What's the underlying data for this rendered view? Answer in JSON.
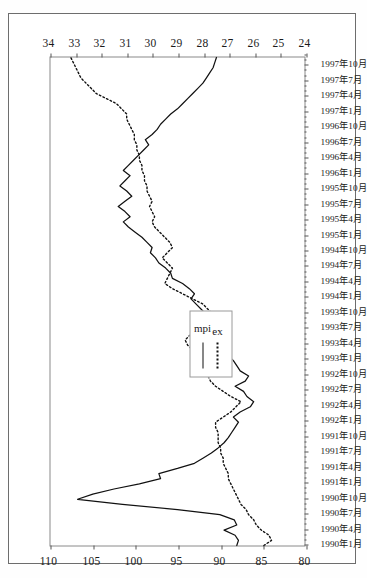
{
  "figure": {
    "orientation": "rotated-90-ccw",
    "background_color": "#ffffff",
    "border_color": "#6d6d6d"
  },
  "legend": {
    "position": "center-left",
    "entries": [
      {
        "label": "mpi",
        "style": "solid",
        "color": "#111111"
      },
      {
        "label": "ex",
        "style": "dotted",
        "color": "#111111"
      }
    ]
  },
  "chart_data": {
    "type": "line",
    "title": "",
    "subtitle": "",
    "xlabel": "",
    "ylabel": "",
    "grid": false,
    "legend_position": "center-left",
    "axes": {
      "left": {
        "name": "mpi",
        "lim": [
          80,
          110
        ],
        "ticks": [
          80,
          85,
          90,
          95,
          100,
          105,
          110
        ],
        "tick_labels": [
          "80",
          "85",
          "90",
          "95",
          "100",
          "105",
          "110"
        ]
      },
      "right": {
        "name": "ex",
        "lim": [
          24,
          34
        ],
        "ticks": [
          24,
          25,
          26,
          27,
          28,
          29,
          30,
          31,
          32,
          33,
          34
        ],
        "tick_labels": [
          "24",
          "25",
          "26",
          "27",
          "28",
          "29",
          "30",
          "31",
          "32",
          "33",
          "34"
        ]
      }
    },
    "x": [
      "1990年1月",
      "1990年2月",
      "1990年3月",
      "1990年4月",
      "1990年5月",
      "1990年6月",
      "1990年7月",
      "1990年8月",
      "1990年9月",
      "1990年10月",
      "1990年11月",
      "1990年12月",
      "1991年1月",
      "1991年2月",
      "1991年3月",
      "1991年4月",
      "1991年5月",
      "1991年6月",
      "1991年7月",
      "1991年8月",
      "1991年9月",
      "1991年10月",
      "1991年11月",
      "1991年12月",
      "1992年1月",
      "1992年2月",
      "1992年3月",
      "1992年4月",
      "1992年5月",
      "1992年6月",
      "1992年7月",
      "1992年8月",
      "1992年9月",
      "1992年10月",
      "1992年11月",
      "1992年12月",
      "1993年1月",
      "1993年2月",
      "1993年3月",
      "1993年4月",
      "1993年5月",
      "1993年6月",
      "1993年7月",
      "1993年8月",
      "1993年9月",
      "1993年10月",
      "1993年11月",
      "1993年12月",
      "1994年1月",
      "1994年2月",
      "1994年3月",
      "1994年4月",
      "1994年5月",
      "1994年6月",
      "1994年7月",
      "1994年8月",
      "1994年9月",
      "1994年10月",
      "1994年11月",
      "1994年12月",
      "1995年1月",
      "1995年2月",
      "1995年3月",
      "1995年4月",
      "1995年5月",
      "1995年6月",
      "1995年7月",
      "1995年8月",
      "1995年9月",
      "1995年10月",
      "1995年11月",
      "1995年12月",
      "1996年1月",
      "1996年2月",
      "1996年3月",
      "1996年4月",
      "1996年5月",
      "1996年6月",
      "1996年7月",
      "1996年8月",
      "1996年9月",
      "1996年10月",
      "1996年11月",
      "1996年12月",
      "1997年1月",
      "1997年2月",
      "1997年3月",
      "1997年4月",
      "1997年5月",
      "1997年6月",
      "1997年7月",
      "1997年8月",
      "1997年9月",
      "1997年10月",
      "1997年11月",
      "1997年12月"
    ],
    "x_tick_labels": [
      "1990年1月",
      "1990年4月",
      "1990年7月",
      "1990年10月",
      "1991年1月",
      "1991年4月",
      "1991年7月",
      "1991年10月",
      "1992年1月",
      "1992年4月",
      "1992年7月",
      "1992年10月",
      "1993年1月",
      "1993年4月",
      "1993年7月",
      "1993年10月",
      "1994年1月",
      "1994年4月",
      "1994年7月",
      "1994年10月",
      "1995年1月",
      "1995年4月",
      "1995年7月",
      "1995年10月",
      "1996年1月",
      "1996年4月",
      "1996年7月",
      "1996年10月",
      "1997年1月",
      "1997年4月",
      "1997年7月",
      "1997年10月"
    ],
    "series": [
      {
        "name": "mpi",
        "axis": "left",
        "style": "solid",
        "values": [
          88.0,
          87.8,
          88.2,
          89.5,
          88.0,
          88.3,
          90.0,
          95.0,
          101.5,
          106.8,
          105.0,
          102.5,
          99.5,
          97.0,
          97.2,
          95.0,
          93.0,
          92.0,
          91.0,
          90.2,
          89.5,
          89.0,
          88.6,
          88.2,
          87.8,
          88.4,
          87.6,
          86.4,
          86.0,
          86.8,
          87.2,
          88.2,
          87.0,
          86.6,
          87.6,
          88.0,
          88.4,
          89.0,
          89.6,
          91.4,
          90.0,
          89.4,
          89.8,
          90.6,
          91.2,
          91.6,
          92.2,
          92.8,
          93.4,
          93.0,
          93.6,
          94.4,
          95.6,
          95.8,
          96.4,
          97.2,
          97.6,
          98.2,
          98.0,
          98.6,
          99.2,
          100.0,
          100.8,
          101.4,
          100.6,
          101.2,
          102.0,
          101.2,
          100.4,
          101.0,
          101.8,
          101.2,
          100.6,
          101.4,
          100.8,
          100.2,
          99.6,
          99.0,
          98.4,
          98.8,
          98.0,
          97.4,
          97.0,
          96.4,
          95.8,
          95.0,
          94.4,
          93.8,
          93.2,
          92.6,
          92.0,
          91.6,
          91.2,
          90.8,
          90.6,
          90.4
        ]
      },
      {
        "name": "ex",
        "axis": "right",
        "style": "dotted",
        "values": [
          25.6,
          25.3,
          25.4,
          25.7,
          25.9,
          26.0,
          26.2,
          26.3,
          26.5,
          26.6,
          26.7,
          26.8,
          26.9,
          27.0,
          27.0,
          27.1,
          27.2,
          27.2,
          27.3,
          27.3,
          27.4,
          27.4,
          27.4,
          27.5,
          27.5,
          27.2,
          26.9,
          26.7,
          26.5,
          26.9,
          27.2,
          27.5,
          27.7,
          27.8,
          27.9,
          28.0,
          28.0,
          28.2,
          28.4,
          28.6,
          28.7,
          28.5,
          28.2,
          27.9,
          27.7,
          27.6,
          27.8,
          28.0,
          28.4,
          28.8,
          29.2,
          29.5,
          29.4,
          29.3,
          29.2,
          29.4,
          29.6,
          29.4,
          29.2,
          29.3,
          29.5,
          29.7,
          29.9,
          30.0,
          29.9,
          30.0,
          30.1,
          30.0,
          30.1,
          30.2,
          30.2,
          30.3,
          30.3,
          30.4,
          30.4,
          30.5,
          30.5,
          30.6,
          30.6,
          30.7,
          30.7,
          30.8,
          30.9,
          31.0,
          31.0,
          31.2,
          31.4,
          31.8,
          32.2,
          32.4,
          32.6,
          32.8,
          32.9,
          33.0,
          33.1,
          33.2
        ]
      }
    ]
  }
}
